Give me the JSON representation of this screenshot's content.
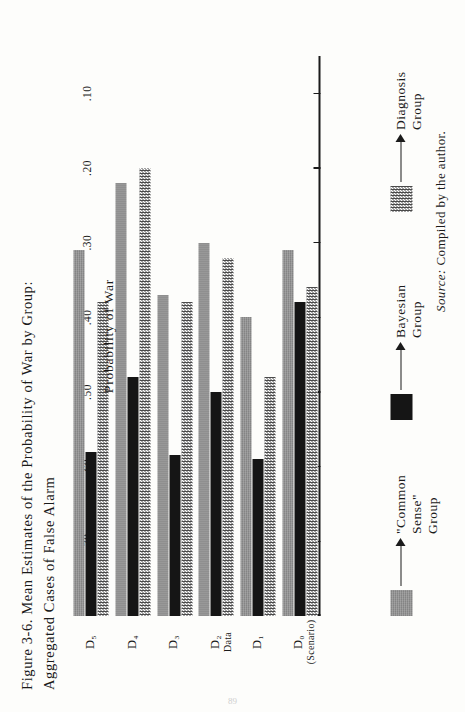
{
  "figure": {
    "title_line1": "Figure 3-6.  Mean Estimates of the Probability of War by Group:",
    "title_line2": "Aggregated Cases of False Alarm",
    "source_prefix": "Source:",
    "source_text": "Compiled by the author."
  },
  "axis": {
    "y_label": "Probability of War",
    "x_label": "Data",
    "tick_labels": [
      ".70",
      ".60",
      ".50",
      ".40",
      ".30",
      ".20",
      ".10"
    ],
    "tick_values": [
      0.7,
      0.6,
      0.5,
      0.4,
      0.3,
      0.2,
      0.1
    ],
    "category_sub": "(Scenario)"
  },
  "legend": {
    "items": [
      {
        "label": "\"Common Sense\" Group",
        "swatch": "gray-swatch"
      },
      {
        "label": "Bayesian Group",
        "swatch": "black-swatch"
      },
      {
        "label": "Diagnosis Group",
        "swatch": "checkered-swatch"
      }
    ]
  },
  "chart_data": {
    "type": "bar",
    "title": "Figure 3-6.  Mean Estimates of the Probability of War by Group: Aggregated Cases of False Alarm",
    "xlabel": "Data",
    "ylabel": "Probability of War",
    "ylim": [
      0,
      0.75
    ],
    "yticks": [
      0.1,
      0.2,
      0.3,
      0.4,
      0.5,
      0.6,
      0.7
    ],
    "grid": false,
    "legend_position": "bottom",
    "categories": [
      "D0",
      "D1",
      "D2",
      "D3",
      "D4",
      "D5"
    ],
    "category_labels": [
      "D₀",
      "D₁",
      "D₂",
      "D₃",
      "D₄",
      "D₅"
    ],
    "series": [
      {
        "name": "\"Common Sense\" Group",
        "color": "#8e8e8e",
        "values": [
          0.49,
          0.4,
          0.5,
          0.43,
          0.58,
          0.49
        ]
      },
      {
        "name": "Bayesian Group",
        "color": "#151515",
        "values": [
          0.42,
          0.21,
          0.3,
          0.215,
          0.32,
          0.22
        ]
      },
      {
        "name": "Diagnosis Group",
        "color": "#4a4a4a",
        "values": [
          0.44,
          0.32,
          0.48,
          0.42,
          0.6,
          0.42
        ]
      }
    ]
  },
  "folio": "89"
}
